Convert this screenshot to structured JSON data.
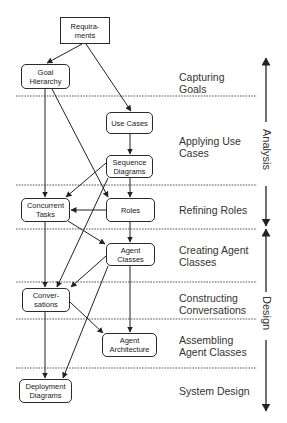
{
  "diagram": {
    "nodes": [
      {
        "id": "requirements",
        "label": "Requira-\nments",
        "shape": "rectangle"
      },
      {
        "id": "goal-hierarchy",
        "label": "Goal\nHierarchy",
        "shape": "rounded"
      },
      {
        "id": "use-cases",
        "label": "Use Cases",
        "shape": "rounded"
      },
      {
        "id": "sequence-diagrams",
        "label": "Sequence\nDiagrams",
        "shape": "rounded"
      },
      {
        "id": "concurrent-tasks",
        "label": "Concurrent\nTasks",
        "shape": "rounded"
      },
      {
        "id": "roles",
        "label": "Roles",
        "shape": "rounded"
      },
      {
        "id": "agent-classes",
        "label": "Agent\nClasses",
        "shape": "rounded"
      },
      {
        "id": "conversations",
        "label": "Conver-\nsations",
        "shape": "rounded"
      },
      {
        "id": "agent-architecture",
        "label": "Agent\nArchitecture",
        "shape": "rounded"
      },
      {
        "id": "deployment-diagrams",
        "label": "Deployment\nDiagrams",
        "shape": "rounded"
      }
    ],
    "edges": [
      {
        "from": "requirements",
        "to": "goal-hierarchy"
      },
      {
        "from": "requirements",
        "to": "use-cases"
      },
      {
        "from": "goal-hierarchy",
        "to": "concurrent-tasks"
      },
      {
        "from": "goal-hierarchy",
        "to": "roles"
      },
      {
        "from": "use-cases",
        "to": "sequence-diagrams"
      },
      {
        "from": "sequence-diagrams",
        "to": "roles"
      },
      {
        "from": "sequence-diagrams",
        "to": "concurrent-tasks"
      },
      {
        "from": "sequence-diagrams",
        "to": "conversations"
      },
      {
        "from": "roles",
        "to": "concurrent-tasks"
      },
      {
        "from": "roles",
        "to": "agent-classes"
      },
      {
        "from": "concurrent-tasks",
        "to": "agent-classes"
      },
      {
        "from": "concurrent-tasks",
        "to": "conversations"
      },
      {
        "from": "agent-classes",
        "to": "conversations"
      },
      {
        "from": "agent-classes",
        "to": "agent-architecture"
      },
      {
        "from": "agent-classes",
        "to": "deployment-diagrams"
      },
      {
        "from": "conversations",
        "to": "agent-architecture"
      },
      {
        "from": "conversations",
        "to": "deployment-diagrams"
      }
    ],
    "phases": [
      {
        "label": "Capturing\nGoals"
      },
      {
        "label": "Applying Use\nCases"
      },
      {
        "label": "Refining Roles"
      },
      {
        "label": "Creating Agent\nClasses"
      },
      {
        "label": "Constructing\nConversations"
      },
      {
        "label": "Assembling\nAgent Classes"
      },
      {
        "label": "System Design"
      }
    ],
    "stages": [
      {
        "label": "Analysis"
      },
      {
        "label": "Design"
      }
    ]
  }
}
